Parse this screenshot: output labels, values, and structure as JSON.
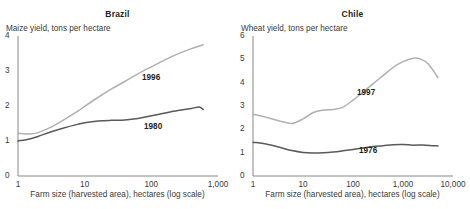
{
  "figure": {
    "background": "#ffffff",
    "axis_color": "#7a7a7a"
  },
  "panels": [
    {
      "key": "brazil",
      "title": "Brazil",
      "y_axis_title": "Maize yield, tons per hectare",
      "x_caption": "Farm size (harvested area), hectares (log scale)",
      "yticks": [
        "0",
        "1",
        "2",
        "3",
        "4"
      ],
      "xticks": [
        "1",
        "10",
        "100",
        "1,000"
      ],
      "series": [
        {
          "name": "1996",
          "color": "#b0b0b0",
          "label": "1996"
        },
        {
          "name": "1980",
          "color": "#5a5a5a",
          "label": "1980"
        }
      ]
    },
    {
      "key": "chile",
      "title": "Chile",
      "y_axis_title": "Wheat yield, tons per hectare",
      "x_caption": "Farm size (harvested area), hectares (log scale)",
      "yticks": [
        "0",
        "1",
        "2",
        "3",
        "4",
        "5",
        "6"
      ],
      "xticks": [
        "1",
        "10",
        "100",
        "1,000",
        "10,000"
      ],
      "series": [
        {
          "name": "1997",
          "color": "#b0b0b0",
          "label": "1997"
        },
        {
          "name": "1976",
          "color": "#5a5a5a",
          "label": "1976"
        }
      ]
    }
  ],
  "chart_data": [
    {
      "type": "line",
      "title": "Brazil",
      "xlabel": "Farm size (harvested area), hectares (log scale)",
      "ylabel": "Maize yield, tons per hectare",
      "xscale": "log",
      "xlim": [
        1,
        1000
      ],
      "ylim": [
        0,
        4
      ],
      "ytick_values": [
        0,
        1,
        2,
        3,
        4
      ],
      "xtick_values": [
        1,
        10,
        100,
        1000
      ],
      "grid": false,
      "legend": "inline-annotation",
      "series": [
        {
          "name": "1996",
          "color": "#b0b0b0",
          "x": [
            1,
            1.5,
            2,
            3,
            5,
            8,
            10,
            16,
            25,
            40,
            63,
            100,
            160,
            250,
            400,
            600
          ],
          "y": [
            1.22,
            1.2,
            1.24,
            1.38,
            1.62,
            1.86,
            1.99,
            2.25,
            2.48,
            2.7,
            2.92,
            3.12,
            3.32,
            3.49,
            3.64,
            3.75
          ]
        },
        {
          "name": "1980",
          "color": "#5a5a5a",
          "x": [
            1,
            1.5,
            2,
            3,
            5,
            8,
            10,
            16,
            25,
            40,
            63,
            100,
            160,
            250,
            400,
            520,
            600
          ],
          "y": [
            1.0,
            1.06,
            1.13,
            1.25,
            1.38,
            1.48,
            1.52,
            1.57,
            1.59,
            1.6,
            1.64,
            1.72,
            1.8,
            1.87,
            1.93,
            1.97,
            1.9
          ]
        }
      ]
    },
    {
      "type": "line",
      "title": "Chile",
      "xlabel": "Farm size (harvested area), hectares (log scale)",
      "ylabel": "Wheat yield, tons per hectare",
      "xscale": "log",
      "xlim": [
        1,
        10000
      ],
      "ylim": [
        0,
        6
      ],
      "ytick_values": [
        0,
        1,
        2,
        3,
        4,
        5,
        6
      ],
      "xtick_values": [
        1,
        10,
        100,
        1000,
        10000
      ],
      "grid": false,
      "legend": "inline-annotation",
      "series": [
        {
          "name": "1997",
          "color": "#b0b0b0",
          "x": [
            1,
            2,
            3.5,
            6,
            10,
            16,
            25,
            40,
            63,
            100,
            160,
            250,
            400,
            630,
            1000,
            1600,
            2200,
            3200,
            5000
          ],
          "y": [
            2.65,
            2.5,
            2.35,
            2.25,
            2.45,
            2.72,
            2.82,
            2.85,
            2.95,
            3.25,
            3.6,
            3.95,
            4.3,
            4.65,
            4.9,
            5.05,
            5.02,
            4.8,
            4.22
          ]
        },
        {
          "name": "1976",
          "color": "#5a5a5a",
          "x": [
            1,
            2,
            3.5,
            6,
            10,
            16,
            25,
            40,
            63,
            100,
            160,
            250,
            400,
            630,
            1000,
            1600,
            2500,
            4000,
            5000
          ],
          "y": [
            1.45,
            1.35,
            1.22,
            1.09,
            1.01,
            0.99,
            1.0,
            1.03,
            1.08,
            1.14,
            1.2,
            1.26,
            1.3,
            1.34,
            1.35,
            1.32,
            1.33,
            1.3,
            1.29
          ]
        }
      ]
    }
  ],
  "annotations": {
    "brazil": [
      {
        "text": "1996",
        "x_pct": 62,
        "y_pct": 27
      },
      {
        "text": "1980",
        "x_pct": 63,
        "y_pct": 62
      }
    ],
    "chile": [
      {
        "text": "1997",
        "x_pct": 52,
        "y_pct": 38
      },
      {
        "text": "1976",
        "x_pct": 53,
        "y_pct": 79
      }
    ]
  }
}
